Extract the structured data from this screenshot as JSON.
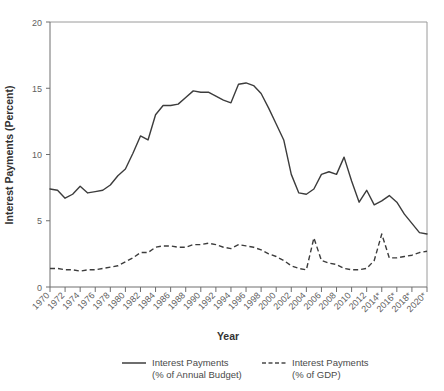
{
  "chart_data": {
    "type": "line",
    "title": "",
    "xlabel": "Year",
    "ylabel": "Interest Payments (Percent)",
    "xlim": [
      1970,
      2020
    ],
    "ylim": [
      0,
      20
    ],
    "yticks": [
      0,
      5,
      10,
      15,
      20
    ],
    "ytick_labels": [
      "0",
      "5",
      "10",
      "15",
      "20"
    ],
    "grid": false,
    "legend_position": "bottom",
    "note": "Asterisk on 2014, 2016, 2018, 2020 tick labels denotes projected values",
    "x": [
      1970,
      1971,
      1972,
      1973,
      1974,
      1975,
      1976,
      1977,
      1978,
      1979,
      1980,
      1981,
      1982,
      1983,
      1984,
      1985,
      1986,
      1987,
      1988,
      1989,
      1990,
      1991,
      1992,
      1993,
      1994,
      1995,
      1996,
      1997,
      1998,
      1999,
      2000,
      2001,
      2002,
      2003,
      2004,
      2005,
      2006,
      2007,
      2008,
      2009,
      2010,
      2011,
      2012,
      2013,
      2014,
      2015,
      2016,
      2017,
      2018,
      2019,
      2020
    ],
    "xtick_labels": [
      "1970",
      "1972",
      "1974",
      "1976",
      "1978",
      "1980",
      "1982",
      "1984",
      "1986",
      "1988",
      "1990",
      "1992",
      "1994",
      "1996",
      "1998",
      "2000",
      "2002",
      "2004",
      "2006",
      "2008",
      "2010",
      "2012",
      "2014*",
      "2016*",
      "2018*",
      "2020*"
    ],
    "series": [
      {
        "name": "Interest Payments (% of Annual Budget)",
        "style": "solid",
        "values": [
          7.4,
          7.3,
          6.7,
          7.0,
          7.6,
          7.1,
          7.2,
          7.3,
          7.7,
          8.4,
          8.9,
          10.1,
          11.4,
          11.1,
          13.0,
          13.7,
          13.7,
          13.8,
          14.3,
          14.8,
          14.7,
          14.7,
          14.4,
          14.1,
          13.9,
          15.3,
          15.4,
          15.2,
          14.6,
          13.5,
          12.3,
          11.1,
          8.5,
          7.1,
          7.0,
          7.4,
          8.5,
          8.7,
          8.5,
          9.8,
          8.0,
          6.4,
          7.3,
          6.2,
          6.5,
          6.9,
          6.4,
          5.5,
          4.8,
          4.1,
          4.0
        ]
      },
      {
        "name": "Interest Payments (% of GDP)",
        "style": "dashed",
        "values": [
          1.4,
          1.4,
          1.3,
          1.3,
          1.2,
          1.3,
          1.3,
          1.4,
          1.5,
          1.6,
          1.9,
          2.2,
          2.6,
          2.6,
          3.0,
          3.1,
          3.1,
          3.0,
          3.0,
          3.2,
          3.2,
          3.3,
          3.2,
          3.0,
          2.9,
          3.2,
          3.1,
          3.0,
          2.8,
          2.5,
          2.3,
          2.0,
          1.6,
          1.4,
          1.3,
          3.7,
          2.0,
          1.8,
          1.7,
          1.4,
          1.3,
          1.3,
          1.4,
          2.0,
          4.0,
          2.2,
          2.2,
          2.3,
          2.4,
          2.6,
          2.7
        ]
      }
    ]
  },
  "legend": {
    "entries": [
      {
        "line1": "Interest Payments",
        "line2": "(% of Annual Budget)",
        "style": "solid"
      },
      {
        "line1": "Interest Payments",
        "line2": "(% of GDP)",
        "style": "dashed"
      }
    ]
  },
  "axes": {
    "y_title": "Interest Payments (Percent)",
    "x_title": "Year"
  }
}
